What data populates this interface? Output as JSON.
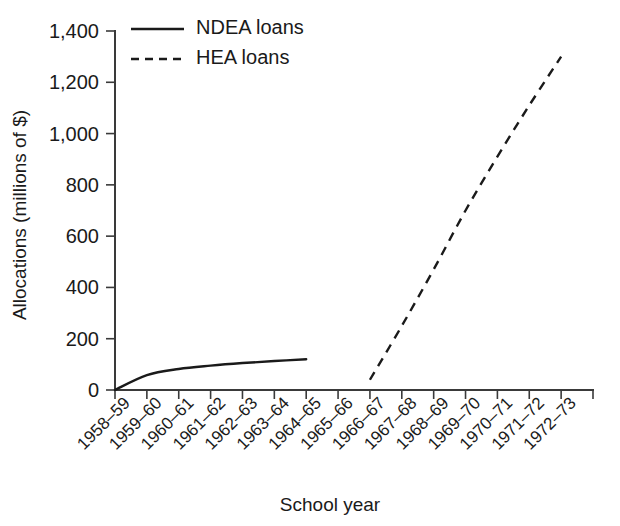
{
  "chart_data": {
    "type": "line",
    "title": "",
    "xlabel": "School year",
    "ylabel": "Allocations (millions of $)",
    "ylim": [
      0,
      1400
    ],
    "yticks": [
      0,
      200,
      400,
      600,
      800,
      1000,
      1200,
      1400
    ],
    "ytick_labels": [
      "0",
      "200",
      "400",
      "600",
      "800",
      "1,000",
      "1,200",
      "1,400"
    ],
    "grid": false,
    "legend_position": "top-left-inside",
    "categories": [
      "1958–59",
      "1959–60",
      "1960–61",
      "1961–62",
      "1962–63",
      "1963–64",
      "1964–65",
      "1965–66",
      "1966–67",
      "1967–68",
      "1968–69",
      "1969–70",
      "1970–71",
      "1971–72",
      "1972–73"
    ],
    "series": [
      {
        "name": "NDEA loans",
        "style": "solid",
        "color": "#1a1a1a",
        "x": [
          "1958–59",
          "1959–60",
          "1960–61",
          "1961–62",
          "1962–63",
          "1963–64",
          "1964–65"
        ],
        "values": [
          0,
          58,
          82,
          95,
          105,
          113,
          120
        ]
      },
      {
        "name": "HEA loans",
        "style": "dashed",
        "color": "#1a1a1a",
        "x": [
          "1966–67",
          "1967–68",
          "1968–69",
          "1969–70",
          "1970–71",
          "1971–72",
          "1972–73"
        ],
        "values": [
          40,
          250,
          470,
          700,
          910,
          1110,
          1300
        ]
      }
    ]
  },
  "legend": {
    "items": [
      {
        "label": "NDEA loans",
        "style": "solid"
      },
      {
        "label": "HEA loans",
        "style": "dashed"
      }
    ]
  },
  "axes": {
    "x_title": "School year",
    "y_title": "Allocations (millions of $)"
  }
}
